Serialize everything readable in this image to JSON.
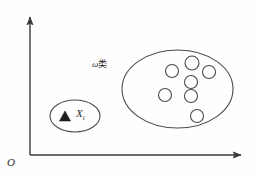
{
  "figure": {
    "background_color": "#fefefe",
    "ink_color": "#3a3a3a",
    "axes": {
      "origin_label": "O",
      "x_axis_name": "horizontal feature axis",
      "y_axis_name": "vertical feature axis",
      "x_axis": {
        "x1": 30,
        "y1": 155,
        "x2": 243,
        "y2": 155
      },
      "y_axis": {
        "x1": 30,
        "y1": 155,
        "x2": 30,
        "y2": 15
      },
      "arrowheads": [
        "x-axis-right",
        "y-axis-up"
      ]
    },
    "class_region": {
      "label_omega": "ω",
      "label_class": "类",
      "label_full": "ω类",
      "ellipse": {
        "cx": 177.5,
        "cy": 89,
        "rx": 55.5,
        "ry": 39
      },
      "member_count": 7,
      "members": [
        {
          "cx": 172,
          "cy": 71,
          "r": 6.5
        },
        {
          "cx": 192,
          "cy": 63,
          "r": 7.0
        },
        {
          "cx": 209,
          "cy": 72,
          "r": 6.5
        },
        {
          "cx": 191,
          "cy": 82,
          "r": 6.5
        },
        {
          "cx": 165,
          "cy": 95,
          "r": 6.5
        },
        {
          "cx": 191,
          "cy": 96,
          "r": 6.5
        },
        {
          "cx": 197,
          "cy": 116,
          "r": 6.5
        }
      ]
    },
    "sample_region": {
      "label_symbol": "X",
      "label_subscript": "i",
      "label_full": "Xi",
      "ellipse": {
        "cx": 75,
        "cy": 116,
        "rx": 25,
        "ry": 16
      },
      "marker_shape": "filled-triangle",
      "marker": {
        "cx": 65,
        "cy": 117,
        "size": 9
      }
    }
  }
}
